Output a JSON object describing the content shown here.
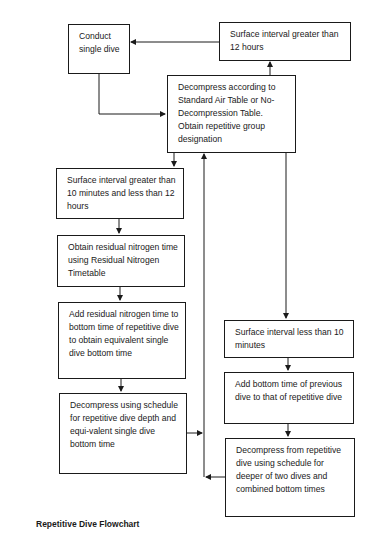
{
  "title": "Repetitive Dive Flowchart",
  "nodes": {
    "conduct_single_dive": "Conduct single dive",
    "si_greater_12h": "Surface interval greater than 12 hours",
    "decompress_standard": "Decompress according to Standard Air Table or No-Decompression Table. Obtain repetitive group designation",
    "si_10min_12h": "Surface interval greater than 10 minutes and less than 12 hours",
    "obtain_residual": "Obtain residual nitrogen time using Residual Nitrogen Timetable",
    "add_residual": "Add residual nitrogen time to bottom time of repetitive dive to obtain equivalent single dive bottom time",
    "decompress_repetitive_schedule": "Decompress using schedule for repetitive dive depth and equi-valent single dive bottom time",
    "si_less_10min": "Surface interval less than 10 minutes",
    "add_bottom_time": "Add bottom time of previous dive to that of repetitive dive",
    "decompress_deeper": "Decompress from repetitive dive using schedule for deeper of two dives and combined bottom times"
  },
  "edges": [
    {
      "from": "conduct_single_dive",
      "to": "decompress_standard"
    },
    {
      "from": "decompress_standard",
      "to": "si_greater_12h"
    },
    {
      "from": "si_greater_12h",
      "to": "conduct_single_dive"
    },
    {
      "from": "decompress_standard",
      "to": "si_10min_12h"
    },
    {
      "from": "si_10min_12h",
      "to": "obtain_residual"
    },
    {
      "from": "obtain_residual",
      "to": "add_residual"
    },
    {
      "from": "add_residual",
      "to": "decompress_repetitive_schedule"
    },
    {
      "from": "decompress_repetitive_schedule",
      "to": "decompress_standard"
    },
    {
      "from": "decompress_standard",
      "to": "si_less_10min"
    },
    {
      "from": "si_less_10min",
      "to": "add_bottom_time"
    },
    {
      "from": "add_bottom_time",
      "to": "decompress_deeper"
    },
    {
      "from": "decompress_deeper",
      "to": "decompress_standard"
    }
  ]
}
